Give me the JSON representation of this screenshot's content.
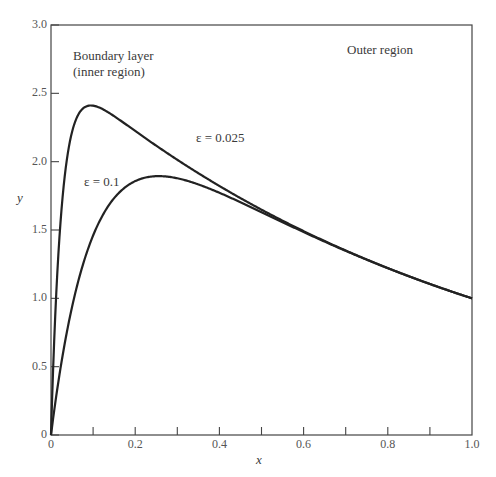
{
  "chart_data": {
    "type": "line",
    "title": "",
    "xlabel": "x",
    "ylabel": "y",
    "xlim": [
      0,
      1.0
    ],
    "ylim": [
      0,
      3.0
    ],
    "grid": false,
    "x_ticks": [
      "0",
      "0.2",
      "0.4",
      "0.6",
      "0.8",
      "1.0"
    ],
    "x_minor_ticks": [
      0.1,
      0.3,
      0.5,
      0.7,
      0.9
    ],
    "y_ticks": [
      "0",
      "0.5",
      "1.0",
      "1.5",
      "2.0",
      "2.5",
      "3.0"
    ],
    "annotations": [
      {
        "text": "Boundary layer",
        "x": 0.03,
        "y": 2.78
      },
      {
        "text": "(inner region)",
        "x": 0.03,
        "y": 2.64
      },
      {
        "text": "Outer region",
        "x": 0.72,
        "y": 2.78
      },
      {
        "text": "ε = 0.025",
        "x": 0.24,
        "y": 2.2
      },
      {
        "text": "ε = 0.1",
        "x": 0.06,
        "y": 1.85
      }
    ],
    "x": [
      0,
      0.005,
      0.01,
      0.02,
      0.03,
      0.04,
      0.05,
      0.06,
      0.08,
      0.1,
      0.12,
      0.15,
      0.2,
      0.25,
      0.3,
      0.35,
      0.4,
      0.45,
      0.5,
      0.6,
      0.7,
      0.8,
      0.9,
      1.0
    ],
    "series": [
      {
        "name": "ε = 0.025",
        "values": [
          0,
          0.49,
          0.89,
          1.48,
          1.87,
          2.13,
          2.3,
          2.39,
          2.44,
          2.41,
          2.37,
          2.3,
          2.2,
          2.12,
          2.01,
          1.92,
          1.82,
          1.73,
          1.65,
          1.49,
          1.35,
          1.22,
          1.11,
          1.0
        ]
      },
      {
        "name": "ε = 0.1",
        "values": [
          0,
          0.13,
          0.26,
          0.51,
          0.72,
          0.91,
          1.07,
          1.21,
          1.44,
          1.62,
          1.74,
          1.84,
          1.86,
          1.89,
          1.85,
          1.78,
          1.71,
          1.66,
          1.63,
          1.49,
          1.35,
          1.22,
          1.11,
          1.0
        ]
      }
    ],
    "legend": "inline labels"
  }
}
